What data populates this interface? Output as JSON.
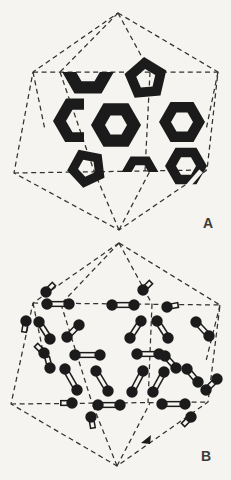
{
  "page": {
    "paper_color": "#f5f4f1",
    "ink_color": "#1b1b1b",
    "dash_color": "#35312c"
  },
  "figure": {
    "panels": [
      {
        "id": "A",
        "label": "A",
        "outline": [
          [
            118,
            13
          ],
          [
            218,
            72
          ],
          [
            207,
            170
          ],
          [
            119,
            230
          ],
          [
            14,
            173
          ],
          [
            33,
            72
          ]
        ],
        "internal": [
          [
            33,
            72,
            218,
            72
          ],
          [
            14,
            173,
            207,
            170
          ],
          [
            118,
            13,
            60,
            72
          ],
          [
            118,
            13,
            150,
            72
          ],
          [
            119,
            230,
            94,
            171
          ],
          [
            119,
            230,
            150,
            171
          ],
          [
            60,
            72,
            94,
            171
          ],
          [
            150,
            72,
            145,
            171
          ],
          [
            33,
            72,
            45,
            130
          ],
          [
            218,
            72,
            206,
            130
          ]
        ],
        "rings": [
          {
            "type": "hex",
            "cx": 88,
            "cy": 70,
            "ro": 27,
            "ri": 13,
            "rot": 0,
            "clip": [
              56,
              72,
              64,
              30
            ]
          },
          {
            "type": "pent",
            "cx": 146,
            "cy": 79,
            "ro": 22,
            "ri": 10,
            "rot": -95
          },
          {
            "type": "hex",
            "cx": 79,
            "cy": 121,
            "ro": 26,
            "ri": 13,
            "rot": 0,
            "clip": [
              44,
              92,
              40,
              50
            ]
          },
          {
            "type": "hex",
            "cx": 116,
            "cy": 125,
            "ro": 25,
            "ri": 11,
            "rot": 0
          },
          {
            "type": "hex",
            "cx": 182,
            "cy": 122,
            "ro": 23,
            "ri": 11,
            "rot": 0
          },
          {
            "type": "pent",
            "cx": 87,
            "cy": 168,
            "ro": 20,
            "ri": 9,
            "rot": -115
          },
          {
            "type": "hex",
            "cx": 140,
            "cy": 173,
            "ro": 19,
            "ri": 9,
            "rot": 0,
            "clip": [
              118,
              150,
              44,
              22
            ]
          },
          {
            "type": "hex",
            "cx": 186,
            "cy": 166,
            "ro": 21,
            "ri": 10,
            "rot": 0,
            "gap": [
              201,
              171,
              187,
              187
            ]
          }
        ]
      },
      {
        "id": "B",
        "label": "B",
        "outline": [
          [
            119,
            243
          ],
          [
            220,
            305
          ],
          [
            208,
            402
          ],
          [
            117,
            466
          ],
          [
            11,
            404
          ],
          [
            33,
            303
          ]
        ],
        "internal": [
          [
            33,
            303,
            220,
            305
          ],
          [
            11,
            404,
            208,
            402
          ],
          [
            119,
            243,
            61,
            304
          ],
          [
            119,
            243,
            152,
            304
          ],
          [
            117,
            466,
            92,
            403
          ],
          [
            117,
            466,
            150,
            403
          ],
          [
            61,
            304,
            92,
            403
          ],
          [
            152,
            304,
            148,
            403
          ],
          [
            33,
            303,
            45,
            361
          ],
          [
            220,
            305,
            206,
            361
          ]
        ],
        "molecules_side": [
          [
            47,
            304,
            69,
            304
          ],
          [
            112,
            305,
            134,
            305
          ],
          [
            39,
            322,
            50,
            339
          ],
          [
            79,
            325,
            67,
            337
          ],
          [
            141,
            321,
            130,
            338
          ],
          [
            157,
            321,
            168,
            338
          ],
          [
            196,
            322,
            209,
            336
          ],
          [
            75,
            355,
            100,
            355
          ],
          [
            137,
            354,
            159,
            354
          ],
          [
            165,
            356,
            176,
            368
          ],
          [
            187,
            369,
            198,
            382
          ],
          [
            65,
            369,
            77,
            390
          ],
          [
            96,
            371,
            108,
            391
          ],
          [
            143,
            371,
            132,
            392
          ],
          [
            164,
            372,
            153,
            392
          ],
          [
            98,
            405,
            120,
            405
          ],
          [
            162,
            404,
            185,
            404
          ],
          [
            206,
            390,
            217,
            379
          ]
        ],
        "molecules_end": [
          [
            46,
            292,
            315
          ],
          [
            143,
            290,
            315
          ],
          [
            167,
            307,
            350
          ],
          [
            26,
            321,
            100
          ],
          [
            44,
            353,
            225
          ],
          [
            50,
            368,
            255
          ],
          [
            72,
            403,
            180
          ],
          [
            91,
            417,
            80
          ],
          [
            191,
            417,
            135
          ]
        ],
        "arrow": [
          [
            141,
            443
          ],
          [
            151,
            435
          ],
          [
            150,
            444
          ]
        ]
      }
    ],
    "atom_radius": 5.7,
    "bond_outer_width": 6.2,
    "bond_inner_width": 3.2
  }
}
